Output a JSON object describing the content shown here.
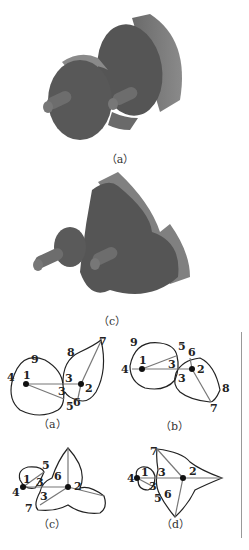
{
  "figure": {
    "panels_3d": [
      {
        "id": "a",
        "caption": "（a）"
      },
      {
        "id": "c",
        "caption": "（c）"
      }
    ],
    "panels_2d": [
      {
        "id": "a",
        "caption": "（a）",
        "labels": [
          "9",
          "8",
          "7",
          "4",
          "1",
          "3",
          "2",
          "3",
          "5",
          "6"
        ]
      },
      {
        "id": "b",
        "caption": "（b）",
        "labels": [
          "9",
          "5",
          "6",
          "4",
          "1",
          "3",
          "2",
          "3",
          "8",
          "7"
        ]
      },
      {
        "id": "c",
        "caption": "（c）",
        "labels": [
          "5",
          "1",
          "3",
          "6",
          "2",
          "4",
          "3",
          "7"
        ]
      },
      {
        "id": "d",
        "caption": "（d）",
        "labels": [
          "7",
          "4",
          "1",
          "3",
          "2",
          "3",
          "5",
          "6"
        ]
      }
    ]
  },
  "colors": {
    "body_dark": "#555555",
    "body_side": "#777777",
    "line": "#222222",
    "divider": "#999999"
  }
}
